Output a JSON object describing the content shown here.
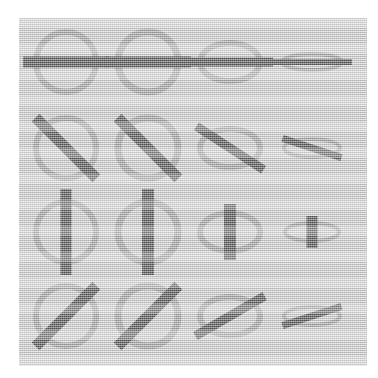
{
  "figure": {
    "title": "Ellipse and bar orientation grid",
    "panel": {
      "background_color": "#c9c9c9",
      "page_color": "#ffffff",
      "left": 19,
      "top": 18,
      "width": 348,
      "height": 348
    },
    "colors": {
      "ellipse_stroke": "#8c8c8c",
      "bar_fill": "#1a1a1a",
      "panel_background": "#c9c9c9",
      "page_background": "#ffffff"
    },
    "grid": {
      "rows": 4,
      "columns": 4,
      "column_centers": [
        66,
        148,
        230,
        312
      ],
      "row_centers": [
        62,
        148,
        232,
        316
      ],
      "row_labels": [
        "horizontal-bar",
        "diagonal-backslash-bar",
        "vertical-bar",
        "diagonal-slash-bar"
      ],
      "column_labels": [
        "circle",
        "circle",
        "ellipse-flattened",
        "ellipse-very-flattened"
      ],
      "ellipse_radii_x": [
        30,
        30,
        30,
        30
      ],
      "ellipse_radii_y": [
        30,
        30,
        19,
        8
      ],
      "ellipse_stroke_widths": [
        6,
        7,
        6,
        4
      ]
    },
    "cells": [
      {
        "id": "r1c1",
        "row": 1,
        "column": 1,
        "name": "circle-horizontal-bar",
        "cx": 66,
        "cy": 62,
        "rx": 30,
        "ry": 30,
        "stroke_width": 6,
        "bar_angle": 0,
        "bar_length": 86,
        "bar_thickness": 11
      },
      {
        "id": "r1c2",
        "row": 1,
        "column": 2,
        "name": "circle-horizontal-bar",
        "cx": 148,
        "cy": 62,
        "rx": 30,
        "ry": 30,
        "stroke_width": 7,
        "bar_angle": 0,
        "bar_length": 86,
        "bar_thickness": 11
      },
      {
        "id": "r1c3",
        "row": 1,
        "column": 3,
        "name": "ellipse-horizontal-bar",
        "cx": 230,
        "cy": 62,
        "rx": 30,
        "ry": 19,
        "stroke_width": 6,
        "bar_angle": 0,
        "bar_length": 86,
        "bar_thickness": 9
      },
      {
        "id": "r1c4",
        "row": 1,
        "column": 4,
        "name": "flat-ellipse-horizontal-bar",
        "cx": 312,
        "cy": 62,
        "rx": 30,
        "ry": 8,
        "stroke_width": 4,
        "bar_angle": 0,
        "bar_length": 80,
        "bar_thickness": 6
      },
      {
        "id": "r2c1",
        "row": 2,
        "column": 1,
        "name": "circle-backslash-bar",
        "cx": 66,
        "cy": 148,
        "rx": 30,
        "ry": 30,
        "stroke_width": 6,
        "bar_angle": 45,
        "bar_length": 86,
        "bar_thickness": 11
      },
      {
        "id": "r2c2",
        "row": 2,
        "column": 2,
        "name": "circle-backslash-bar",
        "cx": 148,
        "cy": 148,
        "rx": 30,
        "ry": 30,
        "stroke_width": 7,
        "bar_angle": 45,
        "bar_length": 86,
        "bar_thickness": 11
      },
      {
        "id": "r2c3",
        "row": 2,
        "column": 3,
        "name": "ellipse-backslash-bar",
        "cx": 230,
        "cy": 148,
        "rx": 30,
        "ry": 19,
        "stroke_width": 6,
        "bar_angle": 33,
        "bar_length": 80,
        "bar_thickness": 9
      },
      {
        "id": "r2c4",
        "row": 2,
        "column": 4,
        "name": "flat-ellipse-backslash-bar",
        "cx": 312,
        "cy": 148,
        "rx": 28,
        "ry": 9,
        "stroke_width": 4,
        "bar_angle": 18,
        "bar_length": 62,
        "bar_thickness": 7
      },
      {
        "id": "r3c1",
        "row": 3,
        "column": 1,
        "name": "circle-vertical-bar",
        "cx": 66,
        "cy": 232,
        "rx": 30,
        "ry": 30,
        "stroke_width": 6,
        "bar_angle": 90,
        "bar_length": 86,
        "bar_thickness": 11
      },
      {
        "id": "r3c2",
        "row": 3,
        "column": 2,
        "name": "circle-vertical-bar",
        "cx": 148,
        "cy": 232,
        "rx": 30,
        "ry": 30,
        "stroke_width": 7,
        "bar_angle": 90,
        "bar_length": 86,
        "bar_thickness": 12
      },
      {
        "id": "r3c3",
        "row": 3,
        "column": 3,
        "name": "ellipse-vertical-bar",
        "cx": 230,
        "cy": 232,
        "rx": 30,
        "ry": 19,
        "stroke_width": 6,
        "bar_angle": 90,
        "bar_length": 56,
        "bar_thickness": 12
      },
      {
        "id": "r3c4",
        "row": 3,
        "column": 4,
        "name": "flat-ellipse-vertical-bar",
        "cx": 312,
        "cy": 232,
        "rx": 27,
        "ry": 9,
        "stroke_width": 4,
        "bar_angle": 90,
        "bar_length": 32,
        "bar_thickness": 11
      },
      {
        "id": "r4c1",
        "row": 4,
        "column": 1,
        "name": "circle-slash-bar",
        "cx": 66,
        "cy": 316,
        "rx": 30,
        "ry": 30,
        "stroke_width": 6,
        "bar_angle": -45,
        "bar_length": 86,
        "bar_thickness": 11
      },
      {
        "id": "r4c2",
        "row": 4,
        "column": 2,
        "name": "circle-slash-bar",
        "cx": 148,
        "cy": 316,
        "rx": 30,
        "ry": 30,
        "stroke_width": 7,
        "bar_angle": -45,
        "bar_length": 86,
        "bar_thickness": 11
      },
      {
        "id": "r4c3",
        "row": 4,
        "column": 3,
        "name": "ellipse-slash-bar",
        "cx": 230,
        "cy": 316,
        "rx": 30,
        "ry": 19,
        "stroke_width": 6,
        "bar_angle": -30,
        "bar_length": 80,
        "bar_thickness": 9
      },
      {
        "id": "r4c4",
        "row": 4,
        "column": 4,
        "name": "flat-ellipse-slash-bar",
        "cx": 312,
        "cy": 316,
        "rx": 28,
        "ry": 9,
        "stroke_width": 4,
        "bar_angle": -18,
        "bar_length": 62,
        "bar_thickness": 7
      }
    ]
  }
}
